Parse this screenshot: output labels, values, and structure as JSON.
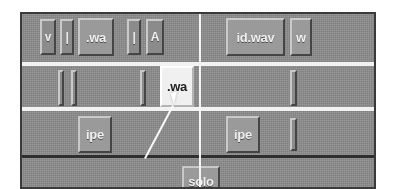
{
  "window": {
    "title": "Tile Grid Panel",
    "background_color": "#8d8d8d",
    "border_color": "#3a3a3a",
    "separator_color": "#f2f2f2",
    "dark_separator_color": "#2e2e2e",
    "selected_tile_color": "#f0f0f0",
    "tile_color": "#9a9a9a"
  },
  "rows": [
    {
      "name": "row-1",
      "left_group": [
        {
          "label": "v",
          "kind": "narrow-button"
        },
        {
          "label": "|",
          "kind": "narrow-button"
        },
        {
          "label": ".wa",
          "kind": "button"
        },
        {
          "label": "|",
          "kind": "narrow-button"
        },
        {
          "label": "A",
          "kind": "narrow-button"
        }
      ],
      "right_group": [
        {
          "label": "id.wav",
          "kind": "button"
        },
        {
          "label": "w",
          "kind": "button"
        }
      ]
    },
    {
      "name": "row-2",
      "left_group": [
        {
          "label": "",
          "kind": "thin-slot"
        },
        {
          "label": "",
          "kind": "thin-slot"
        },
        {
          "label": "",
          "kind": "thin-slot"
        },
        {
          "label": ".wa",
          "kind": "selected-tile"
        }
      ],
      "right_group": [
        {
          "label": "",
          "kind": "thin-slot"
        }
      ]
    },
    {
      "name": "row-3",
      "left_group": [
        {
          "label": "ipe",
          "kind": "button"
        }
      ],
      "right_group": [
        {
          "label": "ipe",
          "kind": "button"
        },
        {
          "label": "",
          "kind": "thin-slot"
        }
      ]
    },
    {
      "name": "row-4",
      "left_group": [],
      "right_group": [
        {
          "label": "solo",
          "kind": "button"
        }
      ]
    }
  ],
  "selection": {
    "tile_label": ".wa",
    "state": "selected"
  },
  "pointer": {
    "name": "mouse-cursor",
    "visible": true
  },
  "drag": {
    "name": "drag-connection-line",
    "visible": true,
    "color": "#ffffff"
  }
}
